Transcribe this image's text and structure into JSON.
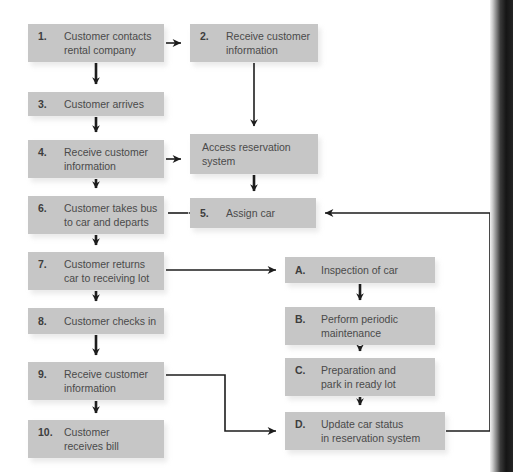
{
  "diagram": {
    "colors": {
      "box_fill": "#c6c6c6",
      "box_shadow": "#d9d9d9",
      "text": "#4a4a4a",
      "number": "#3d3d3d",
      "connector": "#1d1d1d",
      "background": "#ffffff"
    },
    "nodes": [
      {
        "id": "n1",
        "num": "1.",
        "lines": [
          "Customer contacts",
          "rental company"
        ],
        "x": 28,
        "y": 24,
        "w": 136,
        "h": 38
      },
      {
        "id": "n2",
        "num": "2.",
        "lines": [
          "Receive customer",
          "information"
        ],
        "x": 190,
        "y": 24,
        "w": 128,
        "h": 38
      },
      {
        "id": "n3",
        "num": "3.",
        "lines": [
          "Customer arrives"
        ],
        "x": 28,
        "y": 92,
        "w": 136,
        "h": 24
      },
      {
        "id": "n4",
        "num": "4.",
        "lines": [
          "Receive customer",
          "information"
        ],
        "x": 28,
        "y": 140,
        "w": 136,
        "h": 38
      },
      {
        "id": "nacc",
        "num": "",
        "lines": [
          "Access reservation",
          "system"
        ],
        "x": 190,
        "y": 134,
        "w": 128,
        "h": 40
      },
      {
        "id": "n6",
        "num": "6.",
        "lines": [
          "Customer takes bus",
          "to car and departs"
        ],
        "x": 28,
        "y": 196,
        "w": 136,
        "h": 38
      },
      {
        "id": "n5",
        "num": "5.",
        "lines": [
          "Assign car"
        ],
        "x": 190,
        "y": 198,
        "w": 126,
        "h": 30
      },
      {
        "id": "n7",
        "num": "7.",
        "lines": [
          "Customer returns",
          "car to receiving lot"
        ],
        "x": 28,
        "y": 252,
        "w": 136,
        "h": 38
      },
      {
        "id": "nA",
        "num": "A.",
        "lines": [
          "Inspection of car"
        ],
        "x": 285,
        "y": 257,
        "w": 150,
        "h": 26
      },
      {
        "id": "n8",
        "num": "8.",
        "lines": [
          "Customer checks in"
        ],
        "x": 28,
        "y": 308,
        "w": 136,
        "h": 26
      },
      {
        "id": "nB",
        "num": "B.",
        "lines": [
          "Perform periodic",
          "maintenance"
        ],
        "x": 285,
        "y": 307,
        "w": 150,
        "h": 38
      },
      {
        "id": "n9",
        "num": "9.",
        "lines": [
          "Receive customer",
          "information"
        ],
        "x": 28,
        "y": 362,
        "w": 136,
        "h": 38
      },
      {
        "id": "nC",
        "num": "C.",
        "lines": [
          "Preparation and",
          "park in ready lot"
        ],
        "x": 285,
        "y": 358,
        "w": 150,
        "h": 38
      },
      {
        "id": "n10",
        "num": "10.",
        "lines": [
          "Customer",
          "receives bill"
        ],
        "x": 28,
        "y": 420,
        "w": 136,
        "h": 38
      },
      {
        "id": "nD",
        "num": "D.",
        "lines": [
          "Update car status",
          "in reservation system"
        ],
        "x": 285,
        "y": 412,
        "w": 160,
        "h": 38
      }
    ],
    "edges": [
      {
        "from": "n1",
        "to": "n2",
        "kind": "horizontal-arrow"
      },
      {
        "from": "n1",
        "to": "n3",
        "kind": "vertical-arrow"
      },
      {
        "from": "n2",
        "to": "nacc",
        "kind": "vertical-arrow"
      },
      {
        "from": "n3",
        "to": "n4",
        "kind": "vertical-arrow"
      },
      {
        "from": "n4",
        "to": "nacc",
        "kind": "horizontal-arrow"
      },
      {
        "from": "n4",
        "to": "n6",
        "kind": "vertical-arrow"
      },
      {
        "from": "nacc",
        "to": "n5",
        "kind": "vertical-arrow"
      },
      {
        "from": "n5",
        "to": "n6",
        "kind": "horizontal-arrow-left"
      },
      {
        "from": "n6",
        "to": "n7",
        "kind": "vertical-arrow"
      },
      {
        "from": "n7",
        "to": "nA",
        "kind": "horizontal-arrow"
      },
      {
        "from": "n7",
        "to": "n8",
        "kind": "vertical-arrow"
      },
      {
        "from": "nA",
        "to": "nB",
        "kind": "vertical-arrow"
      },
      {
        "from": "n8",
        "to": "n9",
        "kind": "vertical-arrow"
      },
      {
        "from": "nB",
        "to": "nC",
        "kind": "vertical-arrow"
      },
      {
        "from": "n9",
        "to": "n10",
        "kind": "vertical-arrow"
      },
      {
        "from": "n9",
        "to": "nD",
        "kind": "elbow-right-down"
      },
      {
        "from": "nC",
        "to": "nD",
        "kind": "vertical-arrow"
      },
      {
        "from": "nD",
        "to": "n5",
        "kind": "feedback-loop-right"
      }
    ]
  }
}
